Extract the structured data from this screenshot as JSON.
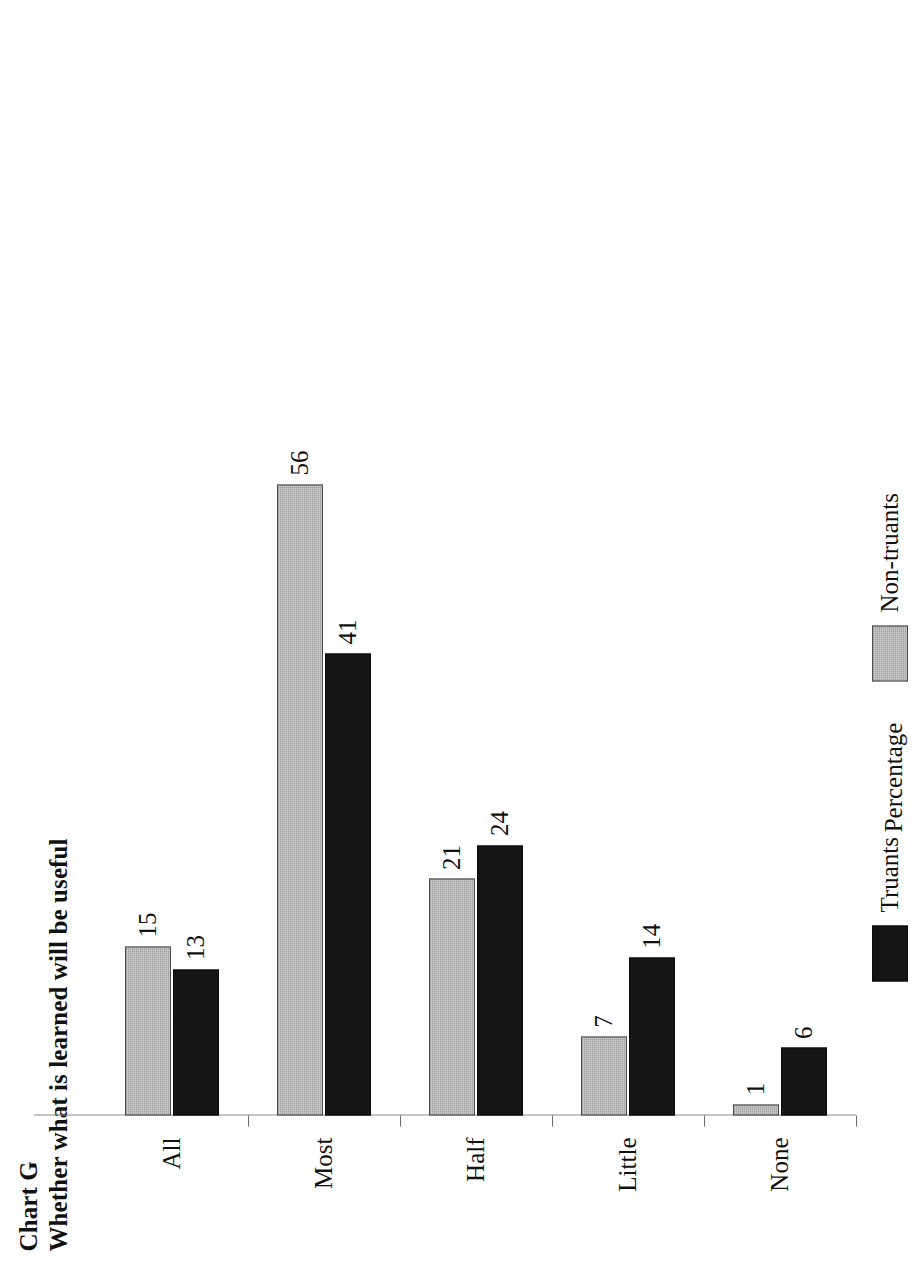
{
  "header": {
    "chart_label": "Chart G",
    "title": "Whether what is learned will be useful"
  },
  "chart_data": {
    "type": "bar",
    "orientation": "vertical",
    "title": "Whether what is learned will be useful",
    "subtitle": "Chart G",
    "xlabel": "",
    "ylabel": "Percentage",
    "categories": [
      "All",
      "Most",
      "Half",
      "Little",
      "None"
    ],
    "series": [
      {
        "name": "Truants",
        "color": "#151515",
        "values": [
          13,
          41,
          24,
          14,
          6
        ]
      },
      {
        "name": "Non-truants",
        "color": "#a0a0a0",
        "values": [
          15,
          56,
          21,
          7,
          1
        ]
      }
    ],
    "ylim": [
      0,
      60
    ],
    "yticks": [
      0,
      10,
      20,
      30,
      40,
      50,
      60
    ],
    "ytick_labels": [
      "0",
      "10",
      "20",
      "30",
      "40",
      "50",
      "60"
    ],
    "grid": false,
    "data_labels": true,
    "legend_position": "bottom",
    "legend": [
      "Truants",
      "Non-truants"
    ]
  },
  "axis": {
    "value_title": "Percentage",
    "ticks": [
      {
        "value": 0,
        "label": "0"
      },
      {
        "value": 10,
        "label": "10"
      },
      {
        "value": 20,
        "label": "20"
      },
      {
        "value": 30,
        "label": "30"
      },
      {
        "value": 40,
        "label": "40"
      },
      {
        "value": 50,
        "label": "50"
      },
      {
        "value": 60,
        "label": "60"
      }
    ]
  },
  "groups": [
    {
      "category": "All",
      "truants": {
        "value": 13,
        "label": "13"
      },
      "nontruants": {
        "value": 15,
        "label": "15"
      }
    },
    {
      "category": "Most",
      "truants": {
        "value": 41,
        "label": "41"
      },
      "nontruants": {
        "value": 56,
        "label": "56"
      }
    },
    {
      "category": "Half",
      "truants": {
        "value": 24,
        "label": "24"
      },
      "nontruants": {
        "value": 21,
        "label": "21"
      }
    },
    {
      "category": "Little",
      "truants": {
        "value": 14,
        "label": "14"
      },
      "nontruants": {
        "value": 7,
        "label": "7"
      }
    },
    {
      "category": "None",
      "truants": {
        "value": 6,
        "label": "6"
      },
      "nontruants": {
        "value": 1,
        "label": "1"
      }
    }
  ],
  "legend": {
    "entries": [
      {
        "name": "Truants",
        "swatch": "truants"
      },
      {
        "name": "Non-truants",
        "swatch": "nontruants"
      }
    ]
  },
  "style": {
    "truants_color": "#151515",
    "nontruants_color": "#a0a0a0",
    "axis_color": "#8b8b8b",
    "text_color": "#111111",
    "background": "#ffffff"
  }
}
